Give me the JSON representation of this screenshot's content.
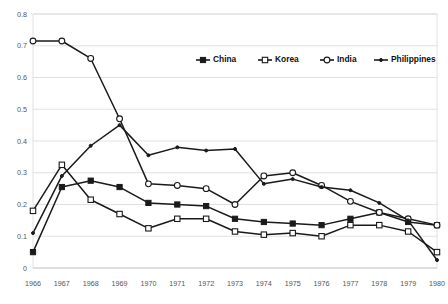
{
  "chart_data": {
    "type": "line",
    "title": "",
    "subtitle": "",
    "xlabel": "",
    "ylabel": "",
    "grid": true,
    "legend_position": "top-center-right",
    "xlim": [
      1966,
      1980
    ],
    "ylim": [
      0,
      0.8
    ],
    "ytick_labels": [
      "0",
      "0.1",
      "0.2",
      "0.3",
      "0.4",
      "0.5",
      "0.6",
      "0.7",
      "0.8"
    ],
    "ytick_values": [
      0,
      0.1,
      0.2,
      0.3,
      0.4,
      0.5,
      0.6,
      0.7,
      0.8
    ],
    "categories": [
      1966,
      1967,
      1968,
      1969,
      1970,
      1971,
      1972,
      1973,
      1974,
      1975,
      1976,
      1977,
      1978,
      1979,
      1980
    ],
    "xtick_labels": [
      "1966",
      "1967",
      "1968",
      "1969",
      "1970",
      "1971",
      "1972",
      "1973",
      "1974",
      "1975",
      "1976",
      "1977",
      "1978",
      "1979",
      "1980"
    ],
    "series": [
      {
        "name": "China",
        "marker": "filled-square",
        "color": "#1a1a1a",
        "values": [
          0.05,
          0.255,
          0.275,
          0.255,
          0.205,
          0.2,
          0.195,
          0.155,
          0.145,
          0.14,
          0.135,
          0.155,
          0.175,
          0.145,
          0.135
        ]
      },
      {
        "name": "Korea",
        "marker": "open-square",
        "color": "#1a1a1a",
        "values": [
          0.18,
          0.325,
          0.215,
          0.17,
          0.125,
          0.155,
          0.155,
          0.115,
          0.105,
          0.11,
          0.1,
          0.135,
          0.135,
          0.115,
          0.05
        ]
      },
      {
        "name": "India",
        "marker": "open-circle",
        "color": "#1a1a1a",
        "values": [
          0.715,
          0.715,
          0.66,
          0.47,
          0.265,
          0.26,
          0.25,
          0.2,
          0.29,
          0.3,
          0.26,
          0.21,
          0.175,
          0.155,
          0.135
        ]
      },
      {
        "name": "Philippines",
        "marker": "small-dot",
        "color": "#1a1a1a",
        "values": [
          0.11,
          0.29,
          0.385,
          0.45,
          0.355,
          0.38,
          0.37,
          0.375,
          0.265,
          0.28,
          0.255,
          0.245,
          0.205,
          0.15,
          0.025
        ]
      }
    ]
  }
}
